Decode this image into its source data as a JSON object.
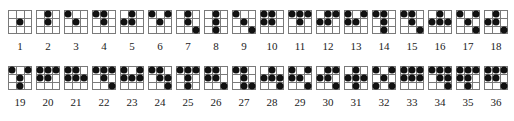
{
  "note": "Dot positions are a best-effort visual reading on an approximate 3x3 cell model; the source places dots at cell corners on a 4x4 vertex lattice. Figures listed in uncertain_figures were hard to resolve and may not match the source exactly.",
  "uncertain_figures": [
    8,
    14,
    25,
    29,
    31,
    36
  ],
  "figures": [
    {
      "label": "1",
      "x": 20,
      "row": 1,
      "dots": [
        [
          1,
          1
        ]
      ]
    },
    {
      "label": "2",
      "x": 48,
      "row": 1,
      "dots": [
        [
          0,
          1
        ],
        [
          1,
          1
        ]
      ]
    },
    {
      "label": "3",
      "x": 76,
      "row": 1,
      "dots": [
        [
          0,
          0
        ],
        [
          1,
          1
        ]
      ]
    },
    {
      "label": "4",
      "x": 104,
      "row": 1,
      "dots": [
        [
          0,
          0
        ],
        [
          0,
          1
        ],
        [
          1,
          1
        ]
      ]
    },
    {
      "label": "5",
      "x": 132,
      "row": 1,
      "dots": [
        [
          0,
          1
        ],
        [
          1,
          0
        ],
        [
          1,
          1
        ]
      ]
    },
    {
      "label": "6",
      "x": 160,
      "row": 1,
      "dots": [
        [
          0,
          0
        ],
        [
          0,
          2
        ],
        [
          1,
          1
        ]
      ]
    },
    {
      "label": "7",
      "x": 188,
      "row": 1,
      "dots": [
        [
          0,
          1
        ],
        [
          1,
          1
        ],
        [
          2,
          2
        ]
      ]
    },
    {
      "label": "8",
      "x": 216,
      "row": 1,
      "dots": [
        [
          0,
          1
        ],
        [
          1,
          1
        ],
        [
          2,
          1
        ]
      ]
    },
    {
      "label": "9",
      "x": 244,
      "row": 1,
      "dots": [
        [
          0,
          0
        ],
        [
          1,
          1
        ],
        [
          2,
          2
        ]
      ]
    },
    {
      "label": "10",
      "x": 272,
      "row": 1,
      "dots": [
        [
          0,
          0
        ],
        [
          0,
          1
        ],
        [
          1,
          0
        ],
        [
          1,
          1
        ]
      ]
    },
    {
      "label": "11",
      "x": 300,
      "row": 1,
      "dots": [
        [
          0,
          0
        ],
        [
          0,
          1
        ],
        [
          0,
          2
        ],
        [
          1,
          1
        ]
      ]
    },
    {
      "label": "12",
      "x": 328,
      "row": 1,
      "dots": [
        [
          0,
          1
        ],
        [
          0,
          2
        ],
        [
          1,
          0
        ],
        [
          1,
          1
        ]
      ]
    },
    {
      "label": "13",
      "x": 356,
      "row": 1,
      "dots": [
        [
          0,
          0
        ],
        [
          0,
          2
        ],
        [
          1,
          0
        ],
        [
          1,
          1
        ]
      ]
    },
    {
      "label": "14",
      "x": 384,
      "row": 1,
      "dots": [
        [
          0,
          0
        ],
        [
          0,
          1
        ],
        [
          1,
          1
        ],
        [
          2,
          1
        ]
      ]
    },
    {
      "label": "15",
      "x": 412,
      "row": 1,
      "dots": [
        [
          0,
          0
        ],
        [
          0,
          1
        ],
        [
          1,
          1
        ],
        [
          2,
          2
        ]
      ]
    },
    {
      "label": "16",
      "x": 440,
      "row": 1,
      "dots": [
        [
          0,
          1
        ],
        [
          1,
          0
        ],
        [
          1,
          1
        ],
        [
          1,
          2
        ]
      ]
    },
    {
      "label": "17",
      "x": 468,
      "row": 1,
      "dots": [
        [
          0,
          0
        ],
        [
          0,
          2
        ],
        [
          1,
          1
        ],
        [
          2,
          2
        ]
      ]
    },
    {
      "label": "18",
      "x": 496,
      "row": 1,
      "dots": [
        [
          0,
          1
        ],
        [
          1,
          0
        ],
        [
          1,
          1
        ],
        [
          2,
          2
        ]
      ]
    },
    {
      "label": "19",
      "x": 20,
      "row": 2,
      "dots": [
        [
          0,
          0
        ],
        [
          0,
          2
        ],
        [
          1,
          1
        ],
        [
          2,
          1
        ]
      ]
    },
    {
      "label": "20",
      "x": 48,
      "row": 2,
      "dots": [
        [
          0,
          0
        ],
        [
          0,
          1
        ],
        [
          0,
          2
        ],
        [
          1,
          0
        ],
        [
          1,
          1
        ]
      ]
    },
    {
      "label": "21",
      "x": 76,
      "row": 2,
      "dots": [
        [
          0,
          0
        ],
        [
          0,
          1
        ],
        [
          1,
          0
        ],
        [
          1,
          1
        ],
        [
          1,
          2
        ]
      ]
    },
    {
      "label": "22",
      "x": 104,
      "row": 2,
      "dots": [
        [
          0,
          0
        ],
        [
          0,
          1
        ],
        [
          0,
          2
        ],
        [
          1,
          1
        ],
        [
          2,
          2
        ]
      ]
    },
    {
      "label": "23",
      "x": 132,
      "row": 2,
      "dots": [
        [
          0,
          0
        ],
        [
          0,
          2
        ],
        [
          1,
          0
        ],
        [
          1,
          1
        ],
        [
          1,
          2
        ]
      ]
    },
    {
      "label": "24",
      "x": 160,
      "row": 2,
      "dots": [
        [
          0,
          0
        ],
        [
          0,
          1
        ],
        [
          1,
          1
        ],
        [
          1,
          2
        ],
        [
          2,
          2
        ]
      ]
    },
    {
      "label": "25",
      "x": 188,
      "row": 2,
      "dots": [
        [
          0,
          0
        ],
        [
          0,
          1
        ],
        [
          0,
          2
        ],
        [
          1,
          1
        ],
        [
          2,
          1
        ]
      ]
    },
    {
      "label": "26",
      "x": 216,
      "row": 2,
      "dots": [
        [
          0,
          0
        ],
        [
          0,
          1
        ],
        [
          1,
          0
        ],
        [
          1,
          1
        ],
        [
          2,
          2
        ]
      ]
    },
    {
      "label": "27",
      "x": 244,
      "row": 2,
      "dots": [
        [
          0,
          0
        ],
        [
          0,
          1
        ],
        [
          1,
          1
        ],
        [
          2,
          1
        ],
        [
          2,
          2
        ]
      ]
    },
    {
      "label": "28",
      "x": 272,
      "row": 2,
      "dots": [
        [
          0,
          1
        ],
        [
          1,
          0
        ],
        [
          1,
          1
        ],
        [
          1,
          2
        ],
        [
          2,
          2
        ]
      ]
    },
    {
      "label": "29",
      "x": 300,
      "row": 2,
      "dots": [
        [
          0,
          0
        ],
        [
          0,
          2
        ],
        [
          1,
          0
        ],
        [
          1,
          1
        ],
        [
          2,
          2
        ]
      ]
    },
    {
      "label": "30",
      "x": 328,
      "row": 2,
      "dots": [
        [
          0,
          1
        ],
        [
          0,
          2
        ],
        [
          1,
          0
        ],
        [
          1,
          1
        ],
        [
          2,
          2
        ]
      ]
    },
    {
      "label": "31",
      "x": 356,
      "row": 2,
      "dots": [
        [
          0,
          1
        ],
        [
          1,
          0
        ],
        [
          1,
          1
        ],
        [
          1,
          2
        ],
        [
          2,
          1
        ]
      ]
    },
    {
      "label": "32",
      "x": 384,
      "row": 2,
      "dots": [
        [
          0,
          0
        ],
        [
          0,
          2
        ],
        [
          1,
          1
        ],
        [
          2,
          0
        ],
        [
          2,
          2
        ]
      ]
    },
    {
      "label": "33",
      "x": 412,
      "row": 2,
      "dots": [
        [
          0,
          0
        ],
        [
          0,
          1
        ],
        [
          0,
          2
        ],
        [
          1,
          0
        ],
        [
          1,
          1
        ],
        [
          1,
          2
        ]
      ]
    },
    {
      "label": "34",
      "x": 440,
      "row": 2,
      "dots": [
        [
          0,
          0
        ],
        [
          0,
          1
        ],
        [
          0,
          2
        ],
        [
          1,
          1
        ],
        [
          1,
          2
        ],
        [
          2,
          2
        ]
      ]
    },
    {
      "label": "35",
      "x": 468,
      "row": 2,
      "dots": [
        [
          0,
          0
        ],
        [
          0,
          1
        ],
        [
          0,
          2
        ],
        [
          1,
          0
        ],
        [
          1,
          1
        ],
        [
          2,
          1
        ]
      ]
    },
    {
      "label": "36",
      "x": 496,
      "row": 2,
      "dots": [
        [
          0,
          0
        ],
        [
          0,
          1
        ],
        [
          0,
          2
        ],
        [
          1,
          0
        ],
        [
          1,
          1
        ],
        [
          2,
          2
        ]
      ]
    }
  ]
}
